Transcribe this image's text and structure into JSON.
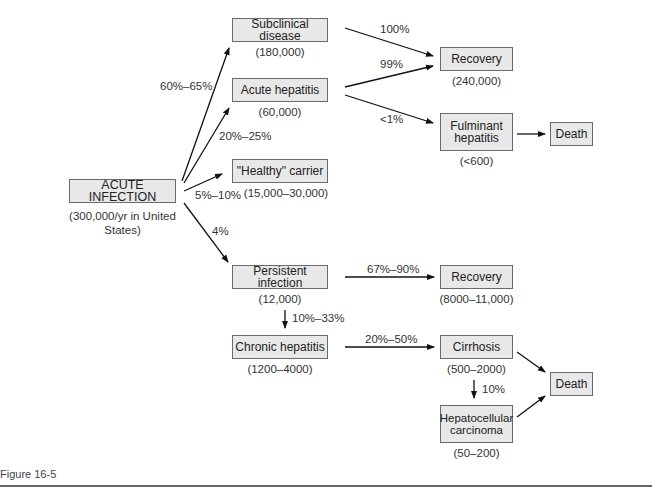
{
  "nodes": {
    "acute_infection": {
      "label": "ACUTE INFECTION",
      "count": "(300,000/yr in United States)"
    },
    "subclinical": {
      "label": "Subclinical disease",
      "count": "(180,000)"
    },
    "acute_hepatitis": {
      "label": "Acute hepatitis",
      "count": "(60,000)"
    },
    "healthy_carrier": {
      "label": "\"Healthy\" carrier",
      "count": "(15,000–30,000)"
    },
    "persistent": {
      "label": "Persistent infection",
      "count": "(12,000)"
    },
    "chronic": {
      "label": "Chronic hepatitis",
      "count": "(1200–4000)"
    },
    "recovery1": {
      "label": "Recovery",
      "count": "(240,000)"
    },
    "fulminant": {
      "label": "Fulminant hepatitis",
      "count": "(<600)"
    },
    "death1": {
      "label": "Death"
    },
    "recovery2": {
      "label": "Recovery",
      "count": "(8000–11,000)"
    },
    "cirrhosis": {
      "label": "Cirrhosis",
      "count": "(500–2000)"
    },
    "hcc": {
      "label": "Hepatocellular carcinoma",
      "count": "(50–200)"
    },
    "death2": {
      "label": "Death"
    }
  },
  "edges": {
    "to_subclinical": "60%–65%",
    "to_acute_hepatitis": "20%–25%",
    "to_carrier": "5%–10%",
    "to_persistent": "4%",
    "subclinical_recovery": "100%",
    "acute_recovery": "99%",
    "acute_fulminant": "<1%",
    "persistent_recovery": "67%–90%",
    "persistent_chronic": "10%–33%",
    "chronic_cirrhosis": "20%–50%",
    "cirrhosis_hcc": "10%"
  },
  "caption": "Figure 16-5"
}
